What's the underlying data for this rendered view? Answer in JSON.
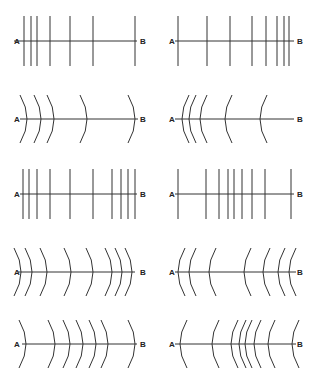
{
  "figure": {
    "label_start": "A",
    "label_end": "B",
    "line_color": "#333333",
    "background": "#ffffff"
  },
  "panels": [
    {
      "id": "r1-left",
      "row": 1,
      "col": 1,
      "shape": "straight",
      "axis_y": 41,
      "a_x": 14,
      "b_x": 143,
      "line_from": 14,
      "line_to": 137,
      "half_height": 25,
      "positions": [
        24,
        31,
        37,
        50,
        70,
        93,
        135
      ]
    },
    {
      "id": "r1-right",
      "row": 1,
      "col": 2,
      "shape": "straight",
      "axis_y": 41,
      "a_x": 169,
      "b_x": 300,
      "line_from": 175,
      "line_to": 294,
      "half_height": 25,
      "positions": [
        178,
        207,
        230,
        252,
        266,
        277,
        284,
        289
      ]
    },
    {
      "id": "r2-left",
      "row": 2,
      "col": 1,
      "shape": "arc-right",
      "axis_y": 119,
      "a_x": 14,
      "b_x": 143,
      "line_from": 20,
      "line_to": 138,
      "half_height": 24,
      "positions": [
        27,
        41,
        54,
        87,
        135
      ]
    },
    {
      "id": "r2-right",
      "row": 2,
      "col": 2,
      "shape": "arc-left",
      "axis_y": 119,
      "a_x": 169,
      "b_x": 300,
      "line_from": 175,
      "line_to": 294,
      "half_height": 24,
      "positions": [
        182,
        189,
        200,
        225,
        260
      ]
    },
    {
      "id": "r3-left",
      "row": 3,
      "col": 1,
      "shape": "straight",
      "axis_y": 194,
      "a_x": 14,
      "b_x": 143,
      "line_from": 20,
      "line_to": 137,
      "half_height": 25,
      "positions": [
        23,
        29,
        37,
        50,
        70,
        93,
        112,
        121,
        128,
        135
      ]
    },
    {
      "id": "r3-right",
      "row": 3,
      "col": 2,
      "shape": "straight",
      "axis_y": 194,
      "a_x": 169,
      "b_x": 300,
      "line_from": 175,
      "line_to": 294,
      "half_height": 25,
      "positions": [
        178,
        206,
        219,
        228,
        234,
        242,
        252,
        265,
        291
      ]
    },
    {
      "id": "r4-left",
      "row": 4,
      "col": 1,
      "shape": "arc-right",
      "axis_y": 272,
      "a_x": 14,
      "b_x": 143,
      "line_from": 18,
      "line_to": 135,
      "half_height": 24,
      "positions": [
        21,
        32,
        47,
        71,
        93,
        112,
        122,
        132
      ]
    },
    {
      "id": "r4-right",
      "row": 4,
      "col": 2,
      "shape": "arc-left",
      "axis_y": 272,
      "a_x": 169,
      "b_x": 300,
      "line_from": 175,
      "line_to": 296,
      "half_height": 24,
      "positions": [
        178,
        189,
        209,
        244,
        263,
        278,
        289
      ]
    },
    {
      "id": "r5-left",
      "row": 5,
      "col": 1,
      "shape": "arc-right",
      "axis_y": 344,
      "a_x": 14,
      "b_x": 143,
      "line_from": 22,
      "line_to": 137,
      "half_height": 24,
      "positions": [
        26,
        55,
        70,
        83,
        96,
        108,
        135
      ]
    },
    {
      "id": "r5-right",
      "row": 5,
      "col": 2,
      "shape": "arc-left",
      "axis_y": 344,
      "a_x": 169,
      "b_x": 300,
      "line_from": 175,
      "line_to": 296,
      "half_height": 24,
      "positions": [
        180,
        212,
        231,
        239,
        245,
        254,
        268,
        292
      ]
    }
  ]
}
